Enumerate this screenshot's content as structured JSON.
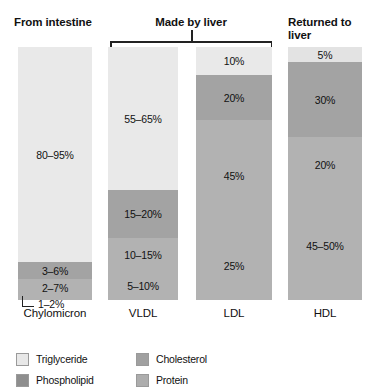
{
  "headers": {
    "from_intestine": "From intestine",
    "made_by_liver": "Made by liver",
    "returned_to_liver": "Returned to\nliver"
  },
  "callout": {
    "chylomicron_protein": "1–2%"
  },
  "legend": {
    "items": [
      {
        "label": "Triglyceride",
        "color": "#e8e8e8"
      },
      {
        "label": "Cholesterol",
        "color": "#a0a0a0"
      },
      {
        "label": "Phospholipid",
        "color": "#8e8e8e"
      },
      {
        "label": "Protein",
        "color": "#adadad"
      }
    ]
  },
  "chart_data": {
    "type": "bar",
    "stacked": true,
    "orientation": "vertical",
    "xlabel": "",
    "ylabel": "",
    "ylim": [
      0,
      100
    ],
    "grid": false,
    "legend_position": "bottom-left",
    "units": "percent of particle mass",
    "categories": [
      "Chylomicron",
      "VLDL",
      "LDL",
      "HDL"
    ],
    "category_groups": [
      {
        "label": "From intestine",
        "categories": [
          "Chylomicron"
        ]
      },
      {
        "label": "Made by liver",
        "categories": [
          "VLDL",
          "LDL"
        ]
      },
      {
        "label": "Returned to liver",
        "categories": [
          "HDL"
        ]
      }
    ],
    "series": [
      {
        "name": "Triglyceride",
        "color": "#e8e8e8",
        "labels": [
          "80–95%",
          "55–65%",
          "10%",
          "5%"
        ],
        "values": [
          87.5,
          60,
          10,
          5
        ]
      },
      {
        "name": "Cholesterol",
        "color": "#a0a0a0",
        "labels": [
          "3–6%",
          "15–20%",
          "20%",
          "30%"
        ],
        "values": [
          4.5,
          17.5,
          20,
          30
        ]
      },
      {
        "name": "Phospholipid",
        "color": "#b0b0b0",
        "labels": [
          "2–7%",
          "10–15%",
          "45%",
          "20%"
        ],
        "values": [
          4.5,
          12.5,
          45,
          20
        ]
      },
      {
        "name": "Protein",
        "color": "#b0b0b0",
        "labels": [
          "1–2%",
          "5–10%",
          "25%",
          "45–50%"
        ],
        "values": [
          1.5,
          7.5,
          25,
          47.5
        ]
      }
    ],
    "columns": [
      {
        "name": "Chylomicron",
        "segments": [
          {
            "component": "Triglyceride",
            "label": "80–95%",
            "height_px": 215,
            "color": "#e9e9e9",
            "show_label": true
          },
          {
            "component": "Cholesterol",
            "label": "3–6%",
            "height_px": 17,
            "color": "#a3a3a3",
            "show_label": true
          },
          {
            "component": "Phospholipid",
            "label": "2–7%",
            "height_px": 17,
            "color": "#b2b2b2",
            "show_label": true
          },
          {
            "component": "Protein",
            "label": "1–2%",
            "height_px": 4,
            "color": "#b2b2b2",
            "show_label": false
          }
        ]
      },
      {
        "name": "VLDL",
        "segments": [
          {
            "component": "Triglyceride",
            "label": "55–65%",
            "height_px": 143,
            "color": "#e9e9e9",
            "show_label": true
          },
          {
            "component": "Cholesterol",
            "label": "15–20%",
            "height_px": 48,
            "color": "#a3a3a3",
            "show_label": true
          },
          {
            "component": "Phospholipid",
            "label": "10–15%",
            "height_px": 33,
            "color": "#b2b2b2",
            "show_label": true
          },
          {
            "component": "Protein",
            "label": "5–10%",
            "height_px": 29,
            "color": "#b2b2b2",
            "show_label": true
          }
        ]
      },
      {
        "name": "LDL",
        "segments": [
          {
            "component": "Triglyceride",
            "label": "10%",
            "height_px": 28,
            "color": "#e9e9e9",
            "show_label": true
          },
          {
            "component": "Cholesterol",
            "label": "20%",
            "height_px": 45,
            "color": "#a3a3a3",
            "show_label": true
          },
          {
            "component": "Phospholipid",
            "label": "45%",
            "height_px": 112,
            "color": "#b2b2b2",
            "show_label": true
          },
          {
            "component": "Protein",
            "label": "25%",
            "height_px": 68,
            "color": "#b2b2b2",
            "show_label": true
          }
        ]
      },
      {
        "name": "HDL",
        "segments": [
          {
            "component": "Triglyceride",
            "label": "5%",
            "height_px": 15,
            "color": "#e3e3e3",
            "show_label": true
          },
          {
            "component": "Cholesterol",
            "label": "30%",
            "height_px": 75,
            "color": "#a3a3a3",
            "show_label": true
          },
          {
            "component": "Phospholipid",
            "label": "20%",
            "height_px": 55,
            "color": "#b2b2b2",
            "show_label": true
          },
          {
            "component": "Protein",
            "label": "45–50%",
            "height_px": 108,
            "color": "#b2b2b2",
            "show_label": true
          }
        ]
      }
    ]
  }
}
